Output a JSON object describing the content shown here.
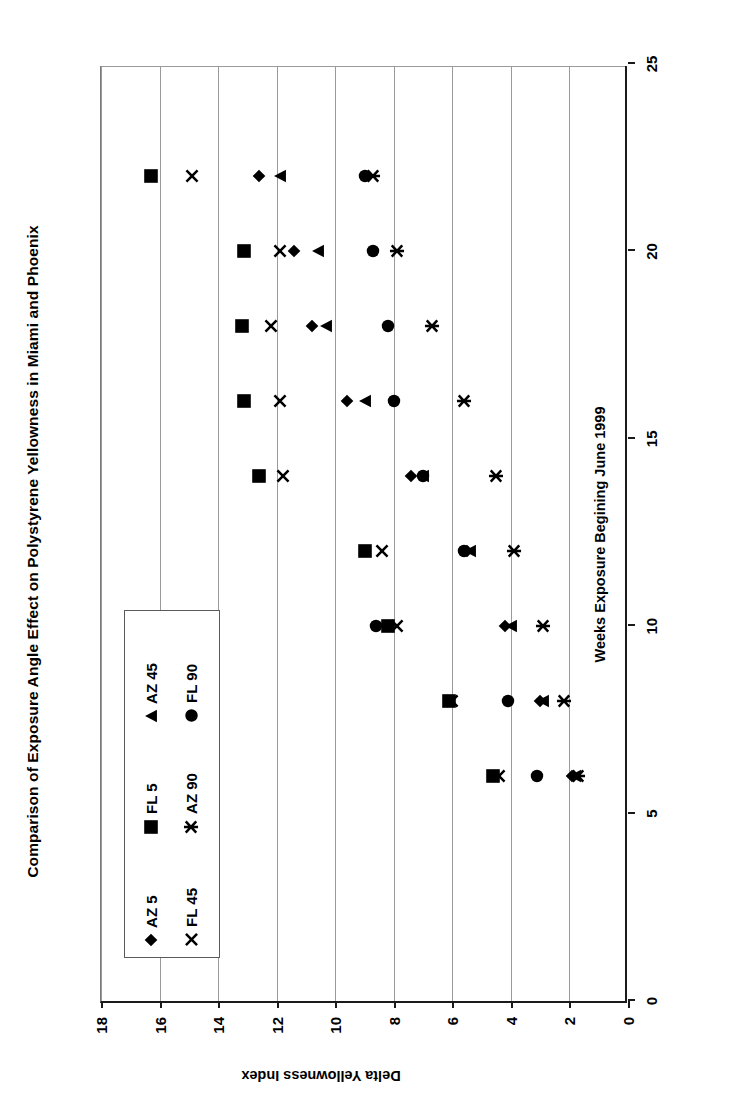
{
  "chart_data": {
    "type": "scatter",
    "title": "Comparison of Exposure Angle Effect on Polystyrene Yellowness in Miami and Phoenix",
    "xlabel": "Weeks Exposure Begining June 1999",
    "ylabel": "Delta Yellowness Index",
    "xlim": [
      0,
      25
    ],
    "ylim": [
      0,
      18
    ],
    "xticks": [
      "0",
      "5",
      "10",
      "15",
      "20",
      "25"
    ],
    "xtick_values": [
      0,
      5,
      10,
      15,
      20,
      25
    ],
    "yticks": [
      "0",
      "2",
      "4",
      "6",
      "8",
      "10",
      "12",
      "14",
      "16",
      "18"
    ],
    "ytick_values": [
      0,
      2,
      4,
      6,
      8,
      10,
      12,
      14,
      16,
      18
    ],
    "grid": "vertical-gridlines-on-value-axis",
    "legend_position": "inside-lower-left",
    "x": [
      6,
      8,
      10,
      12,
      14,
      16,
      18,
      20,
      22
    ],
    "series": [
      {
        "name": "AZ 5",
        "marker": "diamond",
        "values": [
          1.9,
          3.0,
          4.2,
          5.5,
          7.4,
          9.6,
          10.8,
          11.4,
          12.6
        ]
      },
      {
        "name": "FL 5",
        "marker": "square",
        "values": [
          4.6,
          6.1,
          8.2,
          9.0,
          12.6,
          13.1,
          13.2,
          13.1,
          16.3
        ]
      },
      {
        "name": "AZ 45",
        "marker": "triangle",
        "values": [
          1.8,
          2.9,
          4.0,
          5.4,
          7.0,
          9.0,
          10.3,
          10.6,
          11.9
        ]
      },
      {
        "name": "FL 45",
        "marker": "x",
        "values": [
          4.4,
          6.0,
          7.9,
          8.4,
          11.8,
          11.9,
          12.2,
          11.9,
          14.9
        ]
      },
      {
        "name": "AZ 90",
        "marker": "star",
        "values": [
          1.7,
          2.2,
          2.9,
          3.9,
          4.5,
          5.6,
          6.7,
          7.9,
          8.7
        ]
      },
      {
        "name": "FL 90",
        "marker": "circle",
        "values": [
          3.1,
          4.1,
          8.6,
          5.6,
          7.0,
          8.0,
          8.2,
          8.7,
          9.0
        ]
      }
    ]
  },
  "legend": {
    "entries": [
      {
        "label": "AZ 5",
        "marker": "diamond"
      },
      {
        "label": "FL 5",
        "marker": "square"
      },
      {
        "label": "AZ 45",
        "marker": "triangle"
      },
      {
        "label": "FL 45",
        "marker": "x"
      },
      {
        "label": "AZ 90",
        "marker": "star"
      },
      {
        "label": "FL 90",
        "marker": "circle"
      }
    ]
  },
  "colors": {
    "marker": "#000000",
    "axis": "#1a1a1a",
    "grid": "#9a9a9a",
    "background": "#ffffff"
  }
}
